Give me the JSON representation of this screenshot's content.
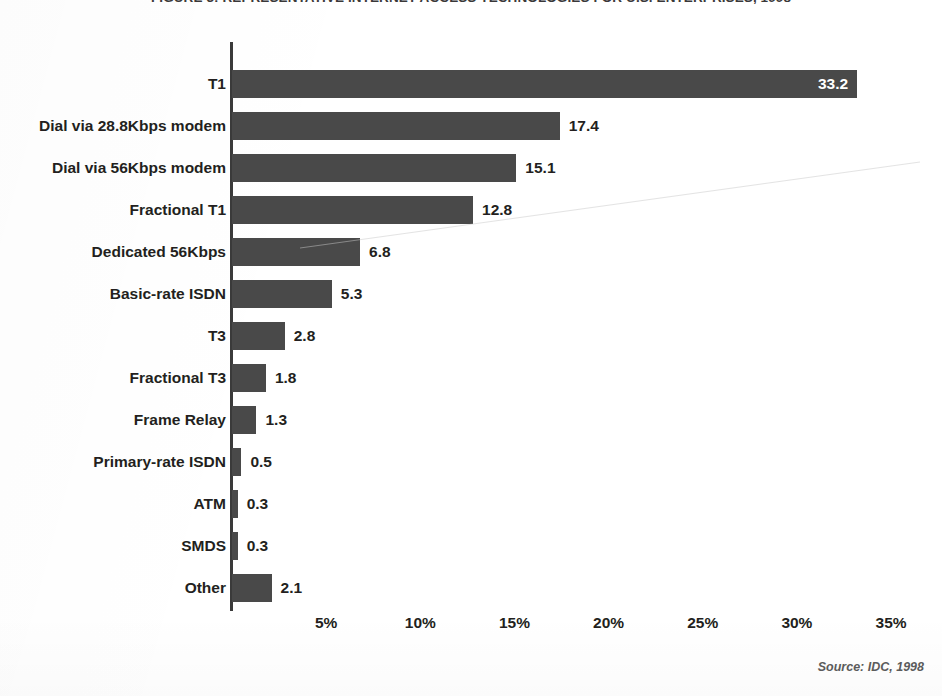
{
  "figure": {
    "title": "FIGURE 3: REPRESENTATIVE INTERNET ACCESS TECHNOLOGIES FOR U.S. ENTERPRISES, 1998",
    "source_note": "Source: IDC, 1998"
  },
  "chart_data": {
    "type": "bar",
    "orientation": "horizontal",
    "title": "FIGURE 3: REPRESENTATIVE INTERNET ACCESS TECHNOLOGIES FOR U.S. ENTERPRISES, 1998",
    "xlabel": "",
    "ylabel": "",
    "xlim": [
      0,
      35
    ],
    "x_tick_labels": [
      "5%",
      "10%",
      "15%",
      "20%",
      "25%",
      "30%",
      "35%"
    ],
    "x_tick_values": [
      5,
      10,
      15,
      20,
      25,
      30,
      35
    ],
    "grid": false,
    "legend": null,
    "bar_color": "#494949",
    "categories": [
      "T1",
      "Dial via 28.8Kbps modem",
      "Dial via 56Kbps modem",
      "Fractional T1",
      "Dedicated 56Kbps",
      "Basic-rate ISDN",
      "T3",
      "Fractional T3",
      "Frame Relay",
      "Primary-rate ISDN",
      "ATM",
      "SMDS",
      "Other"
    ],
    "values": [
      33.2,
      17.4,
      15.1,
      12.8,
      6.8,
      5.3,
      2.8,
      1.8,
      1.3,
      0.5,
      0.3,
      0.3,
      2.1
    ],
    "value_labels": [
      "33.2",
      "17.4",
      "15.1",
      "12.8",
      "6.8",
      "5.3",
      "2.8",
      "1.8",
      "1.3",
      "0.5",
      "0.3",
      "0.3",
      "2.1"
    ],
    "value_label_placement": [
      "inside",
      "outside",
      "outside",
      "outside",
      "outside",
      "outside",
      "outside",
      "outside",
      "outside",
      "outside",
      "outside",
      "outside",
      "outside"
    ]
  }
}
